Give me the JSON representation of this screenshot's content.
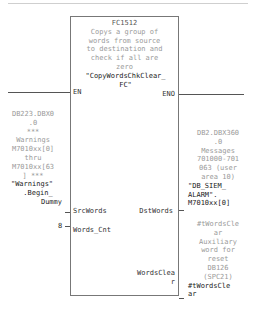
{
  "block": {
    "number": "FC1512",
    "comment_lines": [
      "Copys a group of",
      "words from source",
      "to destination and",
      "check if all are",
      "zero"
    ],
    "name_lines": [
      "\"CopyWordsChkClear_",
      "FC\""
    ],
    "pins": {
      "en": "EN",
      "eno": "ENO",
      "src_words": "SrcWords",
      "words_cnt": "Words_Cnt",
      "dst_words": "DstWords",
      "words_clear_lines": [
        "WordsClea",
        "r"
      ]
    }
  },
  "operands": {
    "src": {
      "address_lines": [
        "DB223.DBX0",
        ".0"
      ],
      "comment_lines": [
        "***",
        "Warnings",
        "M7010xx[0]",
        "thru",
        "M7010xx[63",
        "] ***"
      ],
      "symbol_lines": [
        "\"Warnings\"",
        ".Begin_",
        "Dummy"
      ]
    },
    "words_cnt": "8",
    "dst": {
      "address_lines": [
        "DB2.DBX360",
        ".0"
      ],
      "comment_lines": [
        "Messages",
        "701000-701",
        "063 (user",
        "area 10)"
      ],
      "symbol_lines": [
        "\"DB_SIEM_",
        "ALARM\".",
        "M7010xx[0]"
      ]
    },
    "clear": {
      "comment_lines": [
        "#tWordsCle",
        "ar",
        "Auxiliary",
        "word for",
        "reset",
        "DB126",
        "(SPC21)"
      ],
      "symbol_lines": [
        "#tWordsCle",
        "ar"
      ]
    }
  }
}
